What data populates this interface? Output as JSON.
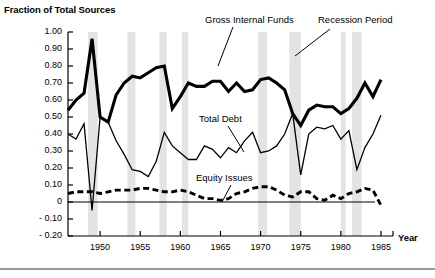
{
  "figure": {
    "width": 435,
    "height": 278,
    "background": "#ffffff",
    "bottom_rule_color": "#9a9a9a"
  },
  "axes": {
    "y_title": "Fraction of Total Sources",
    "x_title": "Year",
    "y_ticks": [
      "1.00",
      "0.90",
      "0.80",
      "0.70",
      "0.60",
      "0.50",
      "0.40",
      "0.30",
      "0.20",
      "0.10",
      "0",
      "- 0.10",
      "- 0.20"
    ],
    "y_tick_values": [
      1.0,
      0.9,
      0.8,
      0.7,
      0.6,
      0.5,
      0.4,
      0.3,
      0.2,
      0.1,
      0,
      -0.1,
      -0.2
    ],
    "x_ticks": [
      "1950",
      "1955",
      "1960",
      "1965",
      "1970",
      "1975",
      "1980",
      "1985"
    ],
    "x_tick_values": [
      1950,
      1955,
      1960,
      1965,
      1970,
      1975,
      1980,
      1985
    ],
    "zero_line": 0
  },
  "annotations": [
    {
      "name": "gross-internal-funds-label",
      "text": "Gross Internal Funds",
      "x": 205,
      "y": 14
    },
    {
      "name": "recession-period-label",
      "text": "Recession Period",
      "x": 318,
      "y": 14
    },
    {
      "name": "total-debt-label",
      "text": "Total Debt",
      "x": 199,
      "y": 113
    },
    {
      "name": "equity-issues-label",
      "text": "Equity Issues",
      "x": 196,
      "y": 172
    }
  ],
  "chart_data": {
    "type": "line",
    "title": "",
    "xlabel": "Year",
    "ylabel": "Fraction of Total Sources",
    "xlim": [
      1946,
      1986.5
    ],
    "ylim": [
      -0.2,
      1.0
    ],
    "grid": false,
    "legend": "inline-annotations",
    "x": [
      1946,
      1947,
      1948,
      1949,
      1950,
      1951,
      1952,
      1953,
      1954,
      1955,
      1956,
      1957,
      1958,
      1959,
      1960,
      1961,
      1962,
      1963,
      1964,
      1965,
      1966,
      1967,
      1968,
      1969,
      1970,
      1971,
      1972,
      1973,
      1974,
      1975,
      1976,
      1977,
      1978,
      1979,
      1980,
      1981,
      1982,
      1983,
      1984,
      1985
    ],
    "series": [
      {
        "name": "Gross Internal Funds",
        "style": "thick-solid",
        "color": "#000000",
        "values": [
          0.54,
          0.6,
          0.64,
          0.96,
          0.5,
          0.47,
          0.63,
          0.7,
          0.74,
          0.73,
          0.76,
          0.79,
          0.8,
          0.55,
          0.62,
          0.7,
          0.68,
          0.68,
          0.71,
          0.71,
          0.65,
          0.7,
          0.65,
          0.66,
          0.72,
          0.73,
          0.7,
          0.66,
          0.52,
          0.45,
          0.54,
          0.57,
          0.56,
          0.56,
          0.52,
          0.55,
          0.61,
          0.7,
          0.62,
          0.72
        ]
      },
      {
        "name": "Total Debt",
        "style": "thin-solid",
        "color": "#000000",
        "values": [
          0.4,
          0.37,
          0.46,
          -0.05,
          0.5,
          0.47,
          0.36,
          0.28,
          0.19,
          0.18,
          0.15,
          0.24,
          0.41,
          0.33,
          0.29,
          0.25,
          0.25,
          0.33,
          0.31,
          0.26,
          0.32,
          0.29,
          0.36,
          0.41,
          0.29,
          0.3,
          0.33,
          0.4,
          0.52,
          0.16,
          0.4,
          0.44,
          0.43,
          0.45,
          0.37,
          0.42,
          0.19,
          0.32,
          0.4,
          0.51
        ]
      },
      {
        "name": "Equity Issues",
        "style": "dashed",
        "color": "#000000",
        "values": [
          0.05,
          0.06,
          0.06,
          0.06,
          0.05,
          0.06,
          0.07,
          0.07,
          0.07,
          0.08,
          0.08,
          0.07,
          0.06,
          0.06,
          0.07,
          0.06,
          0.04,
          0.02,
          0.02,
          0.01,
          0.02,
          0.05,
          0.06,
          0.08,
          0.09,
          0.09,
          0.07,
          0.04,
          0.03,
          0.06,
          0.06,
          0.02,
          0.01,
          0.04,
          0.02,
          0.05,
          0.06,
          0.08,
          0.07,
          -0.02
        ]
      }
    ],
    "shaded_regions": {
      "name": "Recession Period",
      "color": "#e3e3e3",
      "bands": [
        [
          1948.5,
          1949.7
        ],
        [
          1953.4,
          1954.4
        ],
        [
          1957.4,
          1958.3
        ],
        [
          1960.2,
          1961.0
        ],
        [
          1969.7,
          1970.8
        ],
        [
          1973.6,
          1975.0
        ],
        [
          1980.0,
          1980.6
        ],
        [
          1981.4,
          1982.6
        ]
      ]
    }
  }
}
